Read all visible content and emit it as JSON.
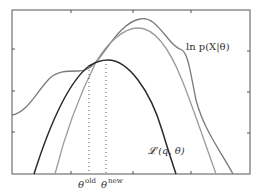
{
  "figure": {
    "labels": {
      "log_likelihood": "ln p(X|θ)",
      "lower_bound": "𝓛 (q, θ)",
      "theta_old_base": "θ",
      "theta_old_sup": "old",
      "theta_new_base": "θ",
      "theta_new_sup": "new"
    },
    "colors": {
      "log_likelihood": "#7a7a7a",
      "new_bound": "#9a9a9a",
      "lower_bound": "#2a2a2a",
      "frame": "#555555",
      "dotted": "#555555"
    },
    "curves": [
      {
        "name": "log-likelihood",
        "label": "ln p(X|θ)"
      },
      {
        "name": "new-lower-bound",
        "label": ""
      },
      {
        "name": "lower-bound",
        "label": "𝓛 (q, θ)"
      }
    ],
    "markers": [
      {
        "name": "theta-old",
        "label": "θ old"
      },
      {
        "name": "theta-new",
        "label": "θ new"
      }
    ]
  }
}
